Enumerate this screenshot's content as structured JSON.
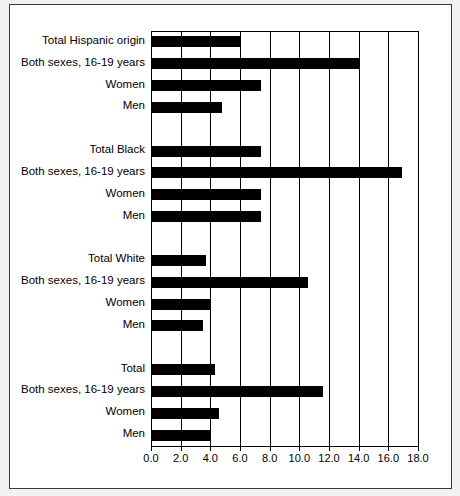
{
  "chart_data": {
    "type": "bar",
    "orientation": "horizontal",
    "title": "",
    "subtitle": "",
    "xlabel": "",
    "ylabel": "",
    "xlim": [
      0.0,
      18.0
    ],
    "xticks": [
      0.0,
      2.0,
      4.0,
      6.0,
      8.0,
      10.0,
      12.0,
      14.0,
      16.0,
      18.0
    ],
    "xtick_labels": [
      "0.0",
      "2.0",
      "4.0",
      "6.0",
      "8.0",
      "10.0",
      "12.0",
      "14.0",
      "16.0",
      "18.0"
    ],
    "grid": true,
    "grid_axis": "x",
    "legend": false,
    "bar_color": "#000000",
    "background_color": "#ffffff",
    "categories": [
      "Total Hispanic origin",
      "Both sexes, 16-19 years",
      "Women",
      "Men",
      "",
      "Total Black",
      "Both sexes, 16-19 years",
      "Women",
      "Men",
      "",
      "Total White",
      "Both sexes, 16-19 years",
      "Women",
      "Men",
      "",
      "Total",
      "Both sexes, 16-19 years",
      "Women",
      "Men"
    ],
    "values": [
      6.0,
      14.0,
      7.4,
      4.8,
      null,
      7.4,
      16.9,
      7.4,
      7.4,
      null,
      3.7,
      10.6,
      4.0,
      3.5,
      null,
      4.3,
      11.6,
      4.6,
      4.0
    ],
    "groups": [
      {
        "name": "Hispanic origin",
        "rows": [
          {
            "label": "Total Hispanic origin",
            "value": 6.0
          },
          {
            "label": "Both sexes, 16-19 years",
            "value": 14.0
          },
          {
            "label": "Women",
            "value": 7.4
          },
          {
            "label": "Men",
            "value": 4.8
          }
        ]
      },
      {
        "name": "Black",
        "rows": [
          {
            "label": "Total Black",
            "value": 7.4
          },
          {
            "label": "Both sexes, 16-19 years",
            "value": 16.9
          },
          {
            "label": "Women",
            "value": 7.4
          },
          {
            "label": "Men",
            "value": 7.4
          }
        ]
      },
      {
        "name": "White",
        "rows": [
          {
            "label": "Total White",
            "value": 3.7
          },
          {
            "label": "Both sexes, 16-19 years",
            "value": 10.6
          },
          {
            "label": "Women",
            "value": 4.0
          },
          {
            "label": "Men",
            "value": 3.5
          }
        ]
      },
      {
        "name": "Total",
        "rows": [
          {
            "label": "Total",
            "value": 4.3
          },
          {
            "label": "Both sexes, 16-19 years",
            "value": 11.6
          },
          {
            "label": "Women",
            "value": 4.6
          },
          {
            "label": "Men",
            "value": 4.0
          }
        ]
      }
    ]
  }
}
